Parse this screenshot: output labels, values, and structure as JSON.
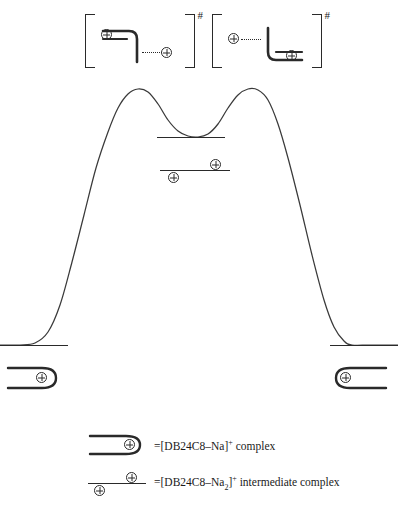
{
  "figure": {
    "type": "energy-profile-diagram"
  },
  "transition_states": [
    {
      "id": "ts-left",
      "bracket_open": "[",
      "bracket_close": "]",
      "superscript": "#",
      "species_label": "DB24C8-Na complex with approaching Na+",
      "ions": [
        {
          "name": "plus-charge-inside",
          "glyph": "⊕",
          "position": "inside-macrocycle"
        },
        {
          "name": "plus-charge-outside",
          "glyph": "⊕",
          "position": "outside-right"
        }
      ],
      "connector": "dotted"
    },
    {
      "id": "ts-right",
      "bracket_open": "[",
      "bracket_close": "]",
      "superscript": "#",
      "species_label": "DB24C8-Na complex with departing Na+",
      "ions": [
        {
          "name": "plus-charge-outside",
          "glyph": "⊕",
          "position": "outside-left"
        },
        {
          "name": "plus-charge-inside",
          "glyph": "⊕",
          "position": "inside-macrocycle"
        }
      ],
      "connector": "dotted"
    }
  ],
  "chart_data": {
    "type": "line",
    "title": "",
    "xlabel": "Reaction coordinate",
    "ylabel": "Potential energy",
    "axis_visible": false,
    "grid": false,
    "legend_position": "bottom",
    "series": [
      {
        "name": "reaction-energy-path",
        "points": [
          [
            0,
            345
          ],
          [
            20,
            345
          ],
          [
            35,
            343
          ],
          [
            48,
            332
          ],
          [
            60,
            305
          ],
          [
            72,
            262
          ],
          [
            84,
            215
          ],
          [
            96,
            168
          ],
          [
            108,
            132
          ],
          [
            118,
            108
          ],
          [
            128,
            94
          ],
          [
            138,
            89
          ],
          [
            148,
            92
          ],
          [
            158,
            104
          ],
          [
            168,
            120
          ],
          [
            178,
            131
          ],
          [
            188,
            136
          ],
          [
            198,
            137
          ],
          [
            208,
            134
          ],
          [
            218,
            124
          ],
          [
            228,
            108
          ],
          [
            238,
            95
          ],
          [
            248,
            89
          ],
          [
            258,
            90
          ],
          [
            268,
            100
          ],
          [
            278,
            124
          ],
          [
            288,
            158
          ],
          [
            300,
            205
          ],
          [
            312,
            255
          ],
          [
            324,
            300
          ],
          [
            334,
            327
          ],
          [
            344,
            341
          ],
          [
            352,
            345
          ],
          [
            370,
            345
          ],
          [
            398,
            345
          ]
        ]
      }
    ],
    "levels": [
      {
        "name": "intermediate-upper-level",
        "y": 137,
        "x_start": 157,
        "x_end": 225,
        "label": ""
      },
      {
        "name": "intermediate-lower-level",
        "y": 170,
        "x_start": 160,
        "x_end": 230,
        "label": "",
        "ions": [
          {
            "name": "plus-charge-above",
            "glyph": "⊕",
            "dx": 50,
            "dy": -10
          },
          {
            "name": "plus-charge-below",
            "glyph": "⊕",
            "dx": 10,
            "dy": 2
          }
        ]
      },
      {
        "name": "reactant-baseline",
        "y": 345,
        "x_start": 0,
        "x_end": 68,
        "label": ""
      },
      {
        "name": "product-baseline",
        "y": 345,
        "x_start": 330,
        "x_end": 398,
        "label": ""
      }
    ],
    "endpoint_complexes": [
      {
        "name": "reactant-complex-left",
        "glyph": "⊕",
        "orientation": "opens-left",
        "x": 8,
        "y": 365
      },
      {
        "name": "product-complex-right",
        "glyph": "⊕",
        "orientation": "opens-right",
        "x": 325,
        "y": 365
      }
    ]
  },
  "legend": {
    "items": [
      {
        "symbol_name": "crown-ether-capsule-symbol",
        "glyph": "⊕",
        "equals": "=",
        "formula_open": "[DB24C8",
        "dash": "–",
        "metal": "Na",
        "formula_close": "]",
        "charge": "+",
        "suffix": " complex",
        "full_text": "=[DB24C8–Na]+ complex"
      },
      {
        "symbol_name": "intermediate-level-symbol",
        "glyph": "⊕",
        "equals": "=",
        "formula_open": "[DB24C8",
        "dash": "–",
        "metal": "Na",
        "subscript": "2",
        "formula_close": "]",
        "charge": "+",
        "suffix": " intermediate complex",
        "full_text": "=[DB24C8–Na2]+ intermediate complex"
      }
    ]
  },
  "colors": {
    "ink": "#2a2a2a",
    "background": "#ffffff",
    "curve": "#3a3a3a"
  }
}
